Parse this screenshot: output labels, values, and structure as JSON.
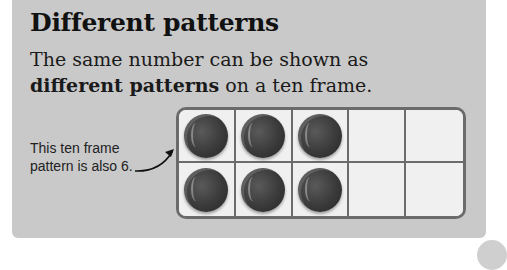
{
  "panel": {
    "title": "Different patterns",
    "description_part1": "The same number can be shown as ",
    "description_bold": "different patterns",
    "description_part2": " on a ten frame."
  },
  "annotation": {
    "line1": "This ten frame",
    "line2": "pattern is also 6."
  },
  "ten_frame": {
    "rows": 2,
    "columns": 5,
    "filled_count": 6,
    "cells": [
      {
        "filled": true
      },
      {
        "filled": true
      },
      {
        "filled": true
      },
      {
        "filled": false
      },
      {
        "filled": false
      },
      {
        "filled": true
      },
      {
        "filled": true
      },
      {
        "filled": true
      },
      {
        "filled": false
      },
      {
        "filled": false
      }
    ]
  }
}
